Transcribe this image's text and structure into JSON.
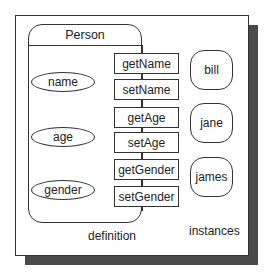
{
  "diagram": {
    "class": {
      "name": "Person",
      "attributes": [
        "name",
        "age",
        "gender"
      ],
      "methods": [
        "getName",
        "setName",
        "getAge",
        "setAge",
        "getGender",
        "setGender"
      ],
      "caption": "definition"
    },
    "instances": {
      "items": [
        "bill",
        "jane",
        "james"
      ],
      "caption": "instances"
    },
    "colors": {
      "line": "#333333",
      "shadow": "#4a4a4a",
      "background": "#ffffff"
    }
  }
}
